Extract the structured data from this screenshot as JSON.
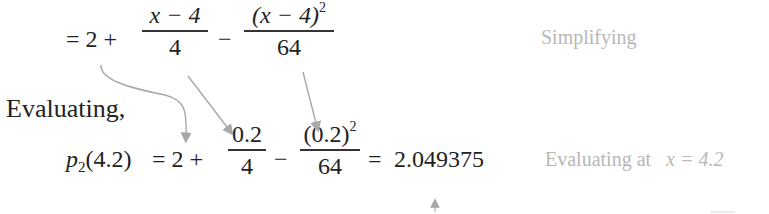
{
  "line1": {
    "equals_two": "= 2 +",
    "frac1": {
      "num": "x − 4",
      "den": "4"
    },
    "minus": "−",
    "frac2": {
      "num": "(x − 4)",
      "num_exp": "2",
      "den": "64"
    },
    "note": "Simplifying"
  },
  "evaluating_label": "Evaluating,",
  "line2": {
    "lhs_p": "p",
    "lhs_sub": "2",
    "lhs_arg": "(4.2)",
    "equals_two": "= 2 +",
    "frac1": {
      "num": "0.2",
      "den": "4"
    },
    "minus": "−",
    "frac2": {
      "num": "(0.2)",
      "num_exp": "2",
      "den": "64"
    },
    "equals": "=",
    "result": "2.049375",
    "note_text": "Evaluating at",
    "note_math": "x = 4.2"
  },
  "colors": {
    "text": "#222222",
    "note": "#b8b8b8",
    "arrow": "#a8a8a8"
  }
}
